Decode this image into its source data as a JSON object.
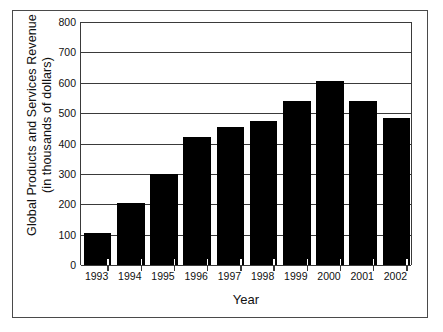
{
  "chart_data": {
    "type": "bar",
    "title": "",
    "xlabel": "Year",
    "ylabel": "Global Products and Services Revenue (in thousands of dollars)",
    "ylabel_line1": "Global Products and Services Revenue",
    "ylabel_line2": "(in thousands of dollars)",
    "categories": [
      "1993",
      "1994",
      "1995",
      "1996",
      "1997",
      "1998",
      "1999",
      "2000",
      "2001",
      "2002"
    ],
    "values": [
      105,
      205,
      300,
      420,
      455,
      475,
      540,
      605,
      540,
      485
    ],
    "ylim": [
      0,
      800
    ],
    "ytick_labels": [
      "0",
      "100",
      "200",
      "300",
      "400",
      "500",
      "600",
      "700",
      "800"
    ],
    "ytick_values": [
      0,
      100,
      200,
      300,
      400,
      500,
      600,
      700,
      800
    ],
    "grid": true,
    "grid_orientation": "horizontal",
    "legend": false,
    "legend_position": "none",
    "bar_color": "#000000",
    "axis_color": "#3a3a3a",
    "background_color": "#ffffff",
    "frame": true
  }
}
